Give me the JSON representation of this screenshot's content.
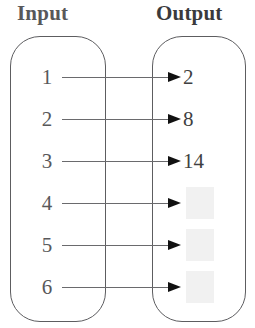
{
  "headers": {
    "input": "Input",
    "output": "Output"
  },
  "colors": {
    "box_stroke": "#5d5d60",
    "connector": "#6a6a6d",
    "arrow": "#111111",
    "input_text": "#58585a",
    "output_text": "#3f3f41",
    "blank_box": "#f1f1f1"
  },
  "rows": [
    {
      "input": "1",
      "output": "2",
      "blank": false,
      "y": 77
    },
    {
      "input": "2",
      "output": "8",
      "blank": false,
      "y": 119
    },
    {
      "input": "3",
      "output": "14",
      "blank": false,
      "y": 161
    },
    {
      "input": "4",
      "output": "",
      "blank": true,
      "y": 203
    },
    {
      "input": "5",
      "output": "",
      "blank": true,
      "y": 245
    },
    {
      "input": "6",
      "output": "",
      "blank": true,
      "y": 287
    }
  ],
  "chart_data": {
    "type": "table",
    "title": "",
    "categories": [
      "1",
      "2",
      "3",
      "4",
      "5",
      "6"
    ],
    "series": [
      {
        "name": "Output",
        "values": [
          2,
          8,
          14,
          null,
          null,
          null
        ]
      }
    ],
    "xlabel": "Input",
    "ylabel": "Output"
  }
}
